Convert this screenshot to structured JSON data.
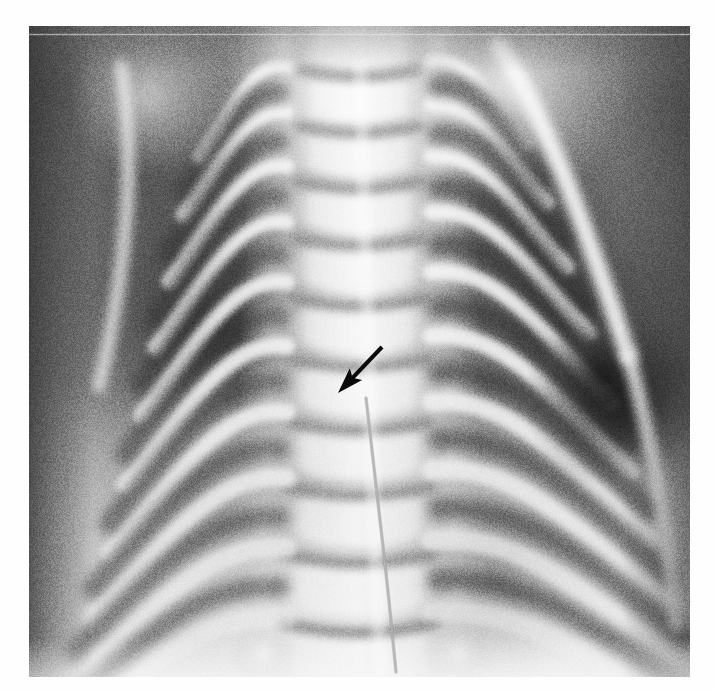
{
  "page": {
    "kind": "medical-radiograph-figure",
    "background_color": "#ffffff",
    "width": 715,
    "height": 691
  },
  "image": {
    "modality": "x-ray",
    "view": "frontal-chest-ap",
    "subject": "neonatal-infant-thorax",
    "title": "Chest radiograph showing thoracic spine and ribs",
    "plate": {
      "left": 29,
      "top": 26,
      "width": 661,
      "height": 651,
      "border_color": "#ffffff"
    },
    "tone": {
      "film_base": "#8e8e8e",
      "lung_dark": "#4a4a4a",
      "lung_darkest": "#1d1d1d",
      "bone_bright": "#f2f2f2",
      "spine_bright": "#ededed",
      "soft_tissue_mid": "#a8a8a8",
      "diaphragm_bright": "#d8d8d8",
      "vignette_edge": "#555555"
    }
  },
  "annotations": {
    "arrow": {
      "name": "pointer-arrow",
      "color": "#0a0a0a",
      "tail_x": 382,
      "tail_y": 347,
      "tip_x": 338,
      "tip_y": 393,
      "shaft_width": 4,
      "head_length": 26,
      "head_width": 17,
      "direction": "down-left",
      "points_at": "midline vertebral body / disc space"
    },
    "catheter_line": {
      "name": "catheter-tube-line",
      "color": "#cfcfcf",
      "visible": true,
      "path": [
        [
          366,
          398
        ],
        [
          372,
          450
        ],
        [
          380,
          520
        ],
        [
          388,
          590
        ],
        [
          396,
          672
        ]
      ]
    }
  },
  "anatomy": {
    "spine": {
      "label": "thoracic-vertebral-column",
      "center_x": 330,
      "top_y": 0,
      "bottom_y": 651,
      "body_width": 150,
      "vertebra_count": 13,
      "disc_space_color": "#989898"
    },
    "ribs_left": {
      "label": "left-rib-cage",
      "count": 9
    },
    "ribs_right": {
      "label": "right-rib-cage",
      "count": 9
    },
    "lung_fields": {
      "left_label": "left-lung-field",
      "right_label": "right-lung-field"
    },
    "diaphragm": {
      "label": "diaphragm-abdomen-region"
    }
  }
}
